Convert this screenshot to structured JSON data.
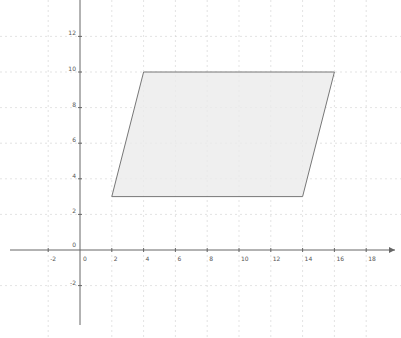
{
  "chart_data": {
    "type": "polygon",
    "title": "",
    "xlabel": "",
    "ylabel": "",
    "xlim": [
      -5,
      19.5
    ],
    "ylim": [
      -4.3,
      14
    ],
    "grid": true,
    "x_ticks": [
      -2,
      0,
      2,
      4,
      6,
      8,
      10,
      12,
      14,
      16,
      18
    ],
    "y_ticks": [
      -2,
      0,
      2,
      4,
      6,
      8,
      10,
      12
    ],
    "polygon": {
      "name": "parallelogram",
      "vertices": [
        [
          2,
          3
        ],
        [
          14,
          3
        ],
        [
          16,
          10
        ],
        [
          4,
          10
        ]
      ],
      "fill": "#ebebeb",
      "stroke": "#777777"
    },
    "axes_color": "#666666",
    "grid_color": "#d0d0d0"
  },
  "labels": {
    "origin_y": "0",
    "origin_x": "0"
  }
}
